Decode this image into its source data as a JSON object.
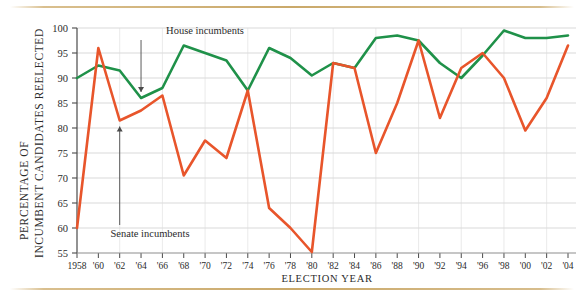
{
  "chart_data": {
    "type": "line",
    "title": "",
    "xlabel": "ELECTION YEAR",
    "ylabel_line1": "PERCENTAGE OF",
    "ylabel_line2": "INCUMBENT CANDIDATES REELECTED",
    "ylabel": "PERCENTAGE OF INCUMBENT CANDIDATES REELECTED",
    "ylim": [
      55,
      100
    ],
    "yticks": [
      55,
      60,
      65,
      70,
      75,
      80,
      85,
      90,
      95,
      100
    ],
    "ytick_labels": [
      "55",
      "60",
      "65",
      "70",
      "75",
      "80",
      "85",
      "90",
      "95",
      "100"
    ],
    "grid": true,
    "grid_axis": "y",
    "legend_position": "inline-annotations",
    "categories": [
      1958,
      1960,
      1962,
      1964,
      1966,
      1968,
      1970,
      1972,
      1974,
      1976,
      1978,
      1980,
      1982,
      1984,
      1986,
      1988,
      1990,
      1992,
      1994,
      1996,
      1998,
      2000,
      2002,
      2004
    ],
    "xtick_labels": [
      "1958",
      "'60",
      "'62",
      "'64",
      "'66",
      "'68",
      "'70",
      "'72",
      "'74",
      "'76",
      "'78",
      "'80",
      "'82",
      "'84",
      "'86",
      "'88",
      "'90",
      "'92",
      "'94",
      "'96",
      "'98",
      "'00",
      "'02",
      "'04"
    ],
    "series": [
      {
        "name": "House incumbents",
        "color": "#1f9149",
        "values": [
          90.0,
          92.5,
          91.5,
          86.0,
          88.0,
          96.5,
          95.0,
          93.5,
          87.5,
          96.0,
          94.0,
          90.5,
          93.0,
          92.0,
          98.0,
          98.5,
          97.5,
          93.0,
          90.0,
          94.5,
          99.5,
          98.0,
          98.0,
          98.5
        ]
      },
      {
        "name": "Senate incumbents",
        "color": "#e8552b",
        "values": [
          60.0,
          96.0,
          81.5,
          83.5,
          86.5,
          70.5,
          77.5,
          74.0,
          87.5,
          64.0,
          60.0,
          55.2,
          93.0,
          92.0,
          75.0,
          85.0,
          97.5,
          82.0,
          92.0,
          95.0,
          90.0,
          79.5,
          86.0,
          96.5
        ]
      }
    ],
    "annotations": [
      {
        "text": "House incumbents",
        "target_year": 1964,
        "target_value": 86.0
      },
      {
        "text": "Senate incumbents",
        "target_year": 1962,
        "target_value": 81.5
      }
    ]
  },
  "decor": {
    "top_rule": "horizontal-rule",
    "bottom_rule": "horizontal-rule"
  }
}
